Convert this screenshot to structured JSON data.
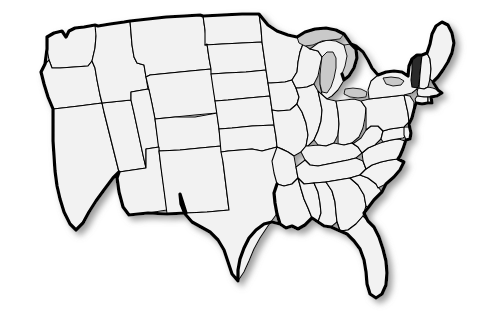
{
  "map": {
    "title": "United States Map",
    "description": "Blank outline map of the contiguous United States with one state shaded",
    "projection": "albers-usa",
    "background_color": "#ffffff",
    "state_fill_color": "#f2f2f2",
    "state_border_color": "#000000",
    "national_outline_color": "#000000",
    "highlight_color": "#2b2b2b",
    "lake_fill_color": "#c9c9c9",
    "shadow": {
      "enabled": true,
      "color": "#9a9a9a",
      "offset_x_px": 4,
      "offset_y_px": 4,
      "blur_px": 4
    },
    "highlighted_states": [
      {
        "code": "VT",
        "name": "Vermont",
        "region": "New England",
        "fill": "#2b2b2b"
      }
    ],
    "water_features": [
      {
        "name": "Lake Superior"
      },
      {
        "name": "Lake Michigan"
      },
      {
        "name": "Lake Huron"
      },
      {
        "name": "Lake Erie"
      },
      {
        "name": "Lake Ontario"
      }
    ],
    "states": [
      {
        "code": "WA",
        "name": "Washington",
        "highlighted": false
      },
      {
        "code": "OR",
        "name": "Oregon",
        "highlighted": false
      },
      {
        "code": "CA",
        "name": "California",
        "highlighted": false
      },
      {
        "code": "NV",
        "name": "Nevada",
        "highlighted": false
      },
      {
        "code": "ID",
        "name": "Idaho",
        "highlighted": false
      },
      {
        "code": "MT",
        "name": "Montana",
        "highlighted": false
      },
      {
        "code": "WY",
        "name": "Wyoming",
        "highlighted": false
      },
      {
        "code": "UT",
        "name": "Utah",
        "highlighted": false
      },
      {
        "code": "AZ",
        "name": "Arizona",
        "highlighted": false
      },
      {
        "code": "CO",
        "name": "Colorado",
        "highlighted": false
      },
      {
        "code": "NM",
        "name": "New Mexico",
        "highlighted": false
      },
      {
        "code": "ND",
        "name": "North Dakota",
        "highlighted": false
      },
      {
        "code": "SD",
        "name": "South Dakota",
        "highlighted": false
      },
      {
        "code": "NE",
        "name": "Nebraska",
        "highlighted": false
      },
      {
        "code": "KS",
        "name": "Kansas",
        "highlighted": false
      },
      {
        "code": "OK",
        "name": "Oklahoma",
        "highlighted": false
      },
      {
        "code": "TX",
        "name": "Texas",
        "highlighted": false
      },
      {
        "code": "MN",
        "name": "Minnesota",
        "highlighted": false
      },
      {
        "code": "IA",
        "name": "Iowa",
        "highlighted": false
      },
      {
        "code": "MO",
        "name": "Missouri",
        "highlighted": false
      },
      {
        "code": "AR",
        "name": "Arkansas",
        "highlighted": false
      },
      {
        "code": "LA",
        "name": "Louisiana",
        "highlighted": false
      },
      {
        "code": "WI",
        "name": "Wisconsin",
        "highlighted": false
      },
      {
        "code": "IL",
        "name": "Illinois",
        "highlighted": false
      },
      {
        "code": "MS",
        "name": "Mississippi",
        "highlighted": false
      },
      {
        "code": "MI",
        "name": "Michigan",
        "highlighted": false
      },
      {
        "code": "IN",
        "name": "Indiana",
        "highlighted": false
      },
      {
        "code": "OH",
        "name": "Ohio",
        "highlighted": false
      },
      {
        "code": "KY",
        "name": "Kentucky",
        "highlighted": false
      },
      {
        "code": "TN",
        "name": "Tennessee",
        "highlighted": false
      },
      {
        "code": "AL",
        "name": "Alabama",
        "highlighted": false
      },
      {
        "code": "GA",
        "name": "Georgia",
        "highlighted": false
      },
      {
        "code": "FL",
        "name": "Florida",
        "highlighted": false
      },
      {
        "code": "SC",
        "name": "South Carolina",
        "highlighted": false
      },
      {
        "code": "NC",
        "name": "North Carolina",
        "highlighted": false
      },
      {
        "code": "VA",
        "name": "Virginia",
        "highlighted": false
      },
      {
        "code": "WV",
        "name": "West Virginia",
        "highlighted": false
      },
      {
        "code": "MD",
        "name": "Maryland",
        "highlighted": false
      },
      {
        "code": "DE",
        "name": "Delaware",
        "highlighted": false
      },
      {
        "code": "PA",
        "name": "Pennsylvania",
        "highlighted": false
      },
      {
        "code": "NJ",
        "name": "New Jersey",
        "highlighted": false
      },
      {
        "code": "NY",
        "name": "New York",
        "highlighted": false
      },
      {
        "code": "CT",
        "name": "Connecticut",
        "highlighted": false
      },
      {
        "code": "RI",
        "name": "Rhode Island",
        "highlighted": false
      },
      {
        "code": "MA",
        "name": "Massachusetts",
        "highlighted": false
      },
      {
        "code": "VT",
        "name": "Vermont",
        "highlighted": true
      },
      {
        "code": "NH",
        "name": "New Hampshire",
        "highlighted": false
      },
      {
        "code": "ME",
        "name": "Maine",
        "highlighted": false
      }
    ]
  }
}
